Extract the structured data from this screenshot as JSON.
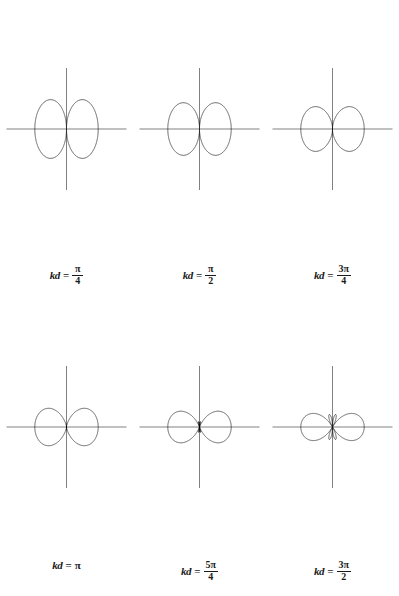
{
  "figure": {
    "background_color": "#ffffff",
    "curve_color": "#1a1a1a",
    "axis_color": "#4a4a4a",
    "columns": 3,
    "rows": 2
  },
  "plots": [
    {
      "id": "plot-kd-pi-over-4",
      "label_prefix": "kd",
      "label_equals": "=",
      "label_numerator": "π",
      "label_denominator": "4",
      "label_plain": "",
      "label_text": "kd = π/4",
      "kd_value": 0.7853981634,
      "kd_expression": "π/4",
      "main_lobe_count": 2,
      "side_lobe_count": 2,
      "main_lobe_half_width_deg": 42,
      "max_radius_px": 122,
      "axis_half_length_px": 60
    },
    {
      "id": "plot-kd-pi-over-2",
      "label_prefix": "kd",
      "label_equals": "=",
      "label_numerator": "π",
      "label_denominator": "2",
      "label_plain": "",
      "label_text": "kd = π/2",
      "kd_value": 1.5707963268,
      "kd_expression": "π/2",
      "main_lobe_count": 2,
      "side_lobe_count": 6,
      "main_lobe_half_width_deg": 20,
      "max_radius_px": 122,
      "axis_half_length_px": 60
    },
    {
      "id": "plot-kd-3pi-over-4",
      "label_prefix": "kd",
      "label_equals": "=",
      "label_numerator": "3π",
      "label_denominator": "4",
      "label_plain": "",
      "label_text": "kd = 3π/4",
      "kd_value": 2.3561944902,
      "kd_expression": "3π/4",
      "main_lobe_count": 2,
      "side_lobe_count": 10,
      "main_lobe_half_width_deg": 13,
      "max_radius_px": 122,
      "axis_half_length_px": 60
    },
    {
      "id": "plot-kd-pi",
      "label_prefix": "kd",
      "label_equals": "=",
      "label_numerator": "",
      "label_denominator": "",
      "label_plain": "π",
      "label_text": "kd = π",
      "kd_value": 3.1415926536,
      "kd_expression": "π",
      "main_lobe_count": 2,
      "side_lobe_count": 14,
      "main_lobe_half_width_deg": 10,
      "max_radius_px": 122,
      "axis_half_length_px": 60
    },
    {
      "id": "plot-kd-5pi-over-4",
      "label_prefix": "kd",
      "label_equals": "=",
      "label_numerator": "5π",
      "label_denominator": "4",
      "label_plain": "",
      "label_text": "kd = 5π/4",
      "kd_value": 3.926990817,
      "kd_expression": "5π/4",
      "main_lobe_count": 2,
      "side_lobe_count": 18,
      "main_lobe_half_width_deg": 8,
      "max_radius_px": 122,
      "axis_half_length_px": 60
    },
    {
      "id": "plot-kd-3pi-over-2",
      "label_prefix": "kd",
      "label_equals": "=",
      "label_numerator": "3π",
      "label_denominator": "2",
      "label_plain": "",
      "label_text": "kd = 3π/2",
      "kd_value": 4.7123889804,
      "kd_expression": "3π/2",
      "main_lobe_count": 2,
      "side_lobe_count": 22,
      "main_lobe_half_width_deg": 7,
      "max_radius_px": 122,
      "axis_half_length_px": 60
    }
  ],
  "chart_data": {
    "type": "line",
    "xlabel": "",
    "ylabel": "",
    "series": [
      {
        "name": "kd = π/4",
        "kd": 0.7853981634,
        "formula": "|sin(theta)| * |cos((kd/2) * cos(theta))|",
        "lobes": 4,
        "peak_normalized": 1.0
      },
      {
        "name": "kd = π/2",
        "kd": 1.5707963268,
        "formula": "|sin(theta)| * |cos((kd/2) * cos(theta))|",
        "lobes": 8,
        "peak_normalized": 1.0
      },
      {
        "name": "kd = 3π/4",
        "kd": 2.3561944902,
        "formula": "|sin(theta)| * |cos((kd/2) * cos(theta))|",
        "lobes": 12,
        "peak_normalized": 1.0
      },
      {
        "name": "kd = π",
        "kd": 3.1415926536,
        "formula": "|sin(theta)| * |cos((kd/2) * cos(theta))|",
        "lobes": 16,
        "peak_normalized": 1.0
      },
      {
        "name": "kd = 5π/4",
        "kd": 3.926990817,
        "formula": "|sin(theta)| * |cos((kd/2) * cos(theta))|",
        "lobes": 20,
        "peak_normalized": 1.0
      },
      {
        "name": "kd = 3π/2",
        "kd": 4.7123889804,
        "formula": "|sin(theta)| * |cos((kd/2) * cos(theta))|",
        "lobes": 24,
        "peak_normalized": 1.0
      }
    ],
    "legend_position": "below-each-plot",
    "grid": false,
    "axis_ranges": {
      "theta_deg": [
        0,
        360
      ],
      "r_normalized": [
        0,
        1
      ]
    }
  }
}
